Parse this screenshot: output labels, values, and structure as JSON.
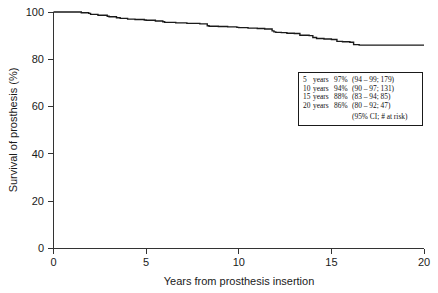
{
  "chart_data": {
    "type": "line",
    "title": "",
    "subtitle": "",
    "xlabel": "Years from prosthesis insertion",
    "ylabel": "Survival of prosthesis (%)",
    "xlim": [
      0,
      20
    ],
    "ylim": [
      0,
      100
    ],
    "xticks": [
      "0",
      "5",
      "10",
      "15",
      "20"
    ],
    "xtick_values": [
      0,
      5,
      10,
      15,
      20
    ],
    "yticks": [
      "0",
      "20",
      "40",
      "60",
      "80",
      "100"
    ],
    "ytick_values": [
      0,
      20,
      40,
      60,
      80,
      100
    ],
    "grid": false,
    "legend_position": "inside-right-upper",
    "curve_style": "kaplan-meier-step",
    "series": [
      {
        "name": "Survival of prosthesis",
        "x": [
          0.0,
          1.0,
          1.5,
          1.9,
          2.0,
          2.4,
          2.9,
          3.0,
          3.4,
          3.6,
          4.0,
          4.4,
          4.9,
          5.0,
          5.5,
          5.9,
          6.0,
          6.6,
          7.2,
          7.9,
          8.0,
          8.3,
          8.4,
          8.9,
          9.4,
          9.9,
          10.0,
          10.5,
          11.0,
          11.4,
          11.8,
          11.9,
          12.0,
          12.3,
          12.6,
          13.0,
          13.3,
          13.8,
          14.0,
          14.2,
          14.6,
          15.0,
          15.3,
          15.6,
          16.0,
          16.2,
          16.5,
          17.0,
          18.0,
          19.0,
          20.0
        ],
        "y": [
          100.0,
          100.0,
          99.7,
          99.4,
          99.0,
          98.6,
          98.2,
          98.0,
          97.6,
          97.3,
          97.0,
          96.8,
          96.6,
          96.5,
          96.2,
          95.9,
          95.6,
          95.4,
          95.2,
          95.0,
          95.0,
          94.2,
          94.0,
          93.9,
          93.7,
          93.5,
          93.4,
          93.2,
          93.0,
          92.8,
          92.0,
          91.6,
          91.4,
          91.3,
          91.0,
          90.9,
          90.2,
          90.0,
          89.2,
          88.8,
          88.6,
          88.4,
          87.6,
          87.4,
          87.2,
          86.2,
          86.0,
          86.0,
          86.0,
          86.0,
          86.0
        ]
      }
    ],
    "annotations": {
      "legend_rows": [
        {
          "time": "5",
          "unit": "years",
          "survival": "97%",
          "interval": "(94 – 99; 179)"
        },
        {
          "time": "10",
          "unit": "years",
          "survival": "94%",
          "interval": "(90 – 97; 131)"
        },
        {
          "time": "15",
          "unit": "years",
          "survival": "88%",
          "interval": "(83 – 94; 85)"
        },
        {
          "time": "20",
          "unit": "years",
          "survival": "86%",
          "interval": "(80 – 92; 47)"
        }
      ],
      "legend_footer": "(95% CI; # at risk)"
    },
    "colors": {
      "curve": "#1a1a1a",
      "axis": "#333333",
      "background": "#ffffff",
      "text": "#1a1a1a"
    }
  }
}
